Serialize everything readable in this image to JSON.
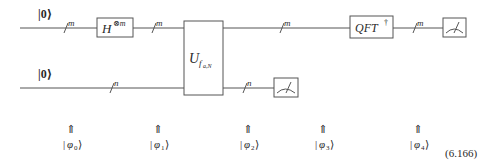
{
  "circuit": {
    "inputs": [
      {
        "label": "|0⟩",
        "register": "m"
      },
      {
        "label": "|0⟩",
        "register": "n"
      }
    ],
    "gates": {
      "hadamard": {
        "base": "H",
        "sup": "⊗m"
      },
      "oracle": {
        "base": "U",
        "sub": "f",
        "subsub": "a,N"
      },
      "qft": {
        "base": "QFT",
        "sup": "†"
      }
    },
    "wire_labels": {
      "top_1": "m",
      "top_2": "m",
      "top_3": "m",
      "top_4": "m",
      "bottom_1": "n",
      "bottom_2": "n"
    },
    "measurements": [
      "top-measure",
      "bottom-measure"
    ]
  },
  "states": [
    {
      "arrow": "⇑",
      "label": "φ",
      "index": "0"
    },
    {
      "arrow": "⇑",
      "label": "φ",
      "index": "1"
    },
    {
      "arrow": "⇑",
      "label": "φ",
      "index": "2"
    },
    {
      "arrow": "⇑",
      "label": "φ",
      "index": "3"
    },
    {
      "arrow": "⇑",
      "label": "φ",
      "index": "4"
    }
  ],
  "equation_number": "(6.166)",
  "colors": {
    "line": "#555555",
    "text": "#2a2a2a",
    "background": "#ffffff"
  }
}
